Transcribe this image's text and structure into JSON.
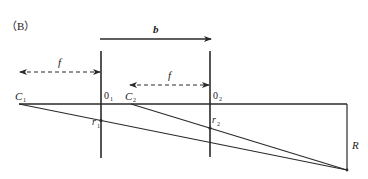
{
  "panel_label": "（B）",
  "labels": {
    "b": "b",
    "f_left": "f",
    "f_right": "f",
    "c1": "C",
    "c1_sub": "1",
    "c2": "C",
    "c2_sub": "2",
    "o1": "0",
    "o1_sub": "1",
    "o2": "0",
    "o2_sub": "2",
    "r1": "r",
    "r1_sub": "1",
    "r2": "r",
    "r2_sub": "2",
    "R": "R"
  },
  "colors": {
    "line": "#2a2a2a",
    "background": "#ffffff"
  }
}
